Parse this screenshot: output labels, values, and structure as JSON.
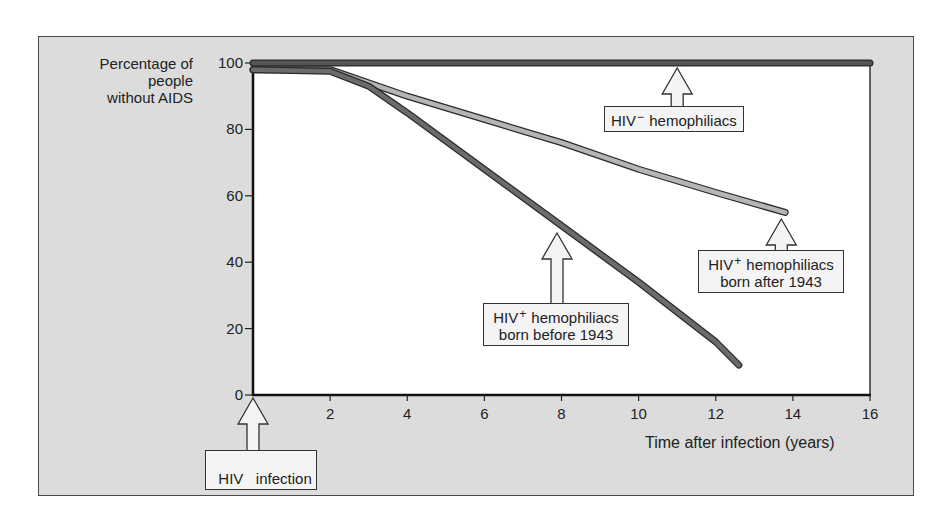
{
  "chart_data": {
    "type": "line",
    "title": "",
    "xlabel": "Time after infection (years)",
    "ylabel": "Percentage of people without AIDS",
    "ylabel_lines": [
      "Percentage of",
      "people",
      "without AIDS"
    ],
    "xlim": [
      0,
      16
    ],
    "ylim": [
      0,
      100
    ],
    "xticks": [
      2,
      4,
      6,
      8,
      10,
      12,
      14,
      16
    ],
    "yticks": [
      0,
      20,
      40,
      60,
      80,
      100
    ],
    "grid": false,
    "legend": "none (inline callout labels)",
    "series": [
      {
        "name": "HIV− hemophiliacs",
        "color": "#555555",
        "x": [
          0,
          16
        ],
        "y": [
          100,
          100
        ]
      },
      {
        "name": "HIV+ hemophiliacs born after 1943",
        "color": "#b5b5b5",
        "x": [
          0,
          2,
          4,
          6,
          8,
          10,
          12,
          13.8
        ],
        "y": [
          98,
          98,
          90,
          83,
          76,
          68,
          61,
          55
        ]
      },
      {
        "name": "HIV+ hemophiliacs born before 1943",
        "color": "#6b6b6b",
        "x": [
          0,
          2,
          3,
          4,
          6,
          8,
          10,
          12,
          12.6
        ],
        "y": [
          98,
          97.5,
          93,
          85,
          68,
          51,
          34,
          16,
          9
        ]
      }
    ],
    "annotations": [
      {
        "text": "HIV− hemophiliacs",
        "points_to": [
          11,
          100
        ]
      },
      {
        "text": "HIV+ hemophiliacs born after 1943",
        "points_to": [
          13.8,
          55
        ]
      },
      {
        "text": "HIV+ hemophiliacs born before 1943",
        "points_to": [
          7.7,
          52
        ]
      },
      {
        "text": "HIV infection",
        "points_to": [
          0,
          0
        ]
      }
    ]
  },
  "labels": {
    "ylabel_line1": "Percentage of",
    "ylabel_line2": "people",
    "ylabel_line3": "without AIDS",
    "xlabel": "Time after infection (years)",
    "callout_hiv_neg_prefix": "HIV",
    "callout_hiv_neg_sup": "−",
    "callout_hiv_neg_suffix": "hemophiliacs",
    "callout_after_prefix": "HIV",
    "callout_after_sup": "+",
    "callout_after_suffix": "hemophiliacs",
    "callout_after_line2": "born after 1943",
    "callout_before_prefix": "HIV",
    "callout_before_sup": "+",
    "callout_before_suffix": "hemophiliacs",
    "callout_before_line2": "born before 1943",
    "callout_infection": "HIV   infection"
  },
  "ticks": {
    "y": [
      "100",
      "80",
      "60",
      "40",
      "20",
      "0"
    ],
    "x": [
      "2",
      "4",
      "6",
      "8",
      "10",
      "12",
      "14",
      "16"
    ]
  }
}
